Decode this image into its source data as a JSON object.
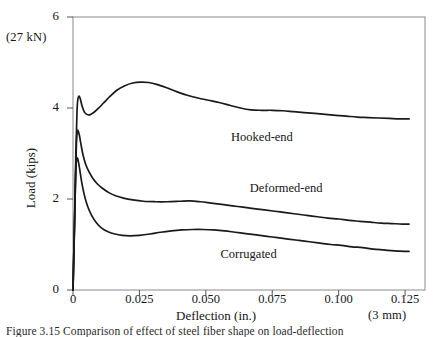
{
  "chart_data": {
    "type": "line",
    "title": "",
    "xlabel": "Deflection (in.)",
    "ylabel": "Load (kips)",
    "xlim": [
      0,
      0.1325
    ],
    "ylim": [
      0,
      6
    ],
    "xticks": [
      "0",
      "0.025",
      "0.050",
      "0.075",
      "0.100",
      "0.125"
    ],
    "xtick_values": [
      0,
      0.025,
      0.05,
      0.075,
      0.1,
      0.125
    ],
    "yticks": [
      "0",
      "2",
      "4",
      "6"
    ],
    "ytick_values": [
      0,
      2,
      4,
      6
    ],
    "grid": false,
    "legend_position": "inline-annotations",
    "annotations": {
      "y_axis_top_note": "(27 kN)",
      "x_axis_right_note": "(3 mm)"
    },
    "series": [
      {
        "name": "Hooked-end",
        "label_x": 0.0595,
        "label_y": 3.33,
        "points": [
          [
            0.0,
            0.0
          ],
          [
            0.0006,
            1.6
          ],
          [
            0.0011,
            3.05
          ],
          [
            0.0015,
            3.9
          ],
          [
            0.0018,
            4.18
          ],
          [
            0.0022,
            4.26
          ],
          [
            0.0027,
            4.21
          ],
          [
            0.0034,
            4.05
          ],
          [
            0.0042,
            3.92
          ],
          [
            0.0052,
            3.86
          ],
          [
            0.0063,
            3.85
          ],
          [
            0.0078,
            3.9
          ],
          [
            0.0095,
            3.99
          ],
          [
            0.0115,
            4.11
          ],
          [
            0.014,
            4.26
          ],
          [
            0.0165,
            4.39
          ],
          [
            0.0195,
            4.49
          ],
          [
            0.0225,
            4.55
          ],
          [
            0.0255,
            4.57
          ],
          [
            0.0285,
            4.56
          ],
          [
            0.0315,
            4.52
          ],
          [
            0.035,
            4.45
          ],
          [
            0.039,
            4.36
          ],
          [
            0.043,
            4.28
          ],
          [
            0.047,
            4.22
          ],
          [
            0.051,
            4.17
          ],
          [
            0.055,
            4.12
          ],
          [
            0.059,
            4.06
          ],
          [
            0.063,
            4.0
          ],
          [
            0.067,
            3.96
          ],
          [
            0.071,
            3.95
          ],
          [
            0.075,
            3.95
          ],
          [
            0.079,
            3.94
          ],
          [
            0.083,
            3.92
          ],
          [
            0.087,
            3.9
          ],
          [
            0.091,
            3.88
          ],
          [
            0.095,
            3.86
          ],
          [
            0.099,
            3.84
          ],
          [
            0.103,
            3.82
          ],
          [
            0.107,
            3.8
          ],
          [
            0.111,
            3.79
          ],
          [
            0.115,
            3.78
          ],
          [
            0.119,
            3.77
          ],
          [
            0.123,
            3.76
          ],
          [
            0.1265,
            3.76
          ]
        ]
      },
      {
        "name": "Deformed-end",
        "label_x": 0.0665,
        "label_y": 2.22,
        "points": [
          [
            0.0,
            0.0
          ],
          [
            0.0006,
            1.45
          ],
          [
            0.001,
            2.6
          ],
          [
            0.0013,
            3.25
          ],
          [
            0.0016,
            3.48
          ],
          [
            0.0019,
            3.5
          ],
          [
            0.0024,
            3.4
          ],
          [
            0.003,
            3.2
          ],
          [
            0.0038,
            2.96
          ],
          [
            0.0048,
            2.76
          ],
          [
            0.006,
            2.6
          ],
          [
            0.0075,
            2.45
          ],
          [
            0.0092,
            2.33
          ],
          [
            0.0112,
            2.23
          ],
          [
            0.0135,
            2.14
          ],
          [
            0.016,
            2.07
          ],
          [
            0.019,
            2.02
          ],
          [
            0.0225,
            1.98
          ],
          [
            0.0265,
            1.95
          ],
          [
            0.031,
            1.94
          ],
          [
            0.0355,
            1.94
          ],
          [
            0.04,
            1.95
          ],
          [
            0.044,
            1.96
          ],
          [
            0.048,
            1.94
          ],
          [
            0.052,
            1.91
          ],
          [
            0.056,
            1.88
          ],
          [
            0.06,
            1.85
          ],
          [
            0.064,
            1.82
          ],
          [
            0.068,
            1.79
          ],
          [
            0.072,
            1.76
          ],
          [
            0.076,
            1.73
          ],
          [
            0.08,
            1.7
          ],
          [
            0.084,
            1.67
          ],
          [
            0.088,
            1.64
          ],
          [
            0.092,
            1.61
          ],
          [
            0.096,
            1.58
          ],
          [
            0.1,
            1.56
          ],
          [
            0.104,
            1.53
          ],
          [
            0.108,
            1.51
          ],
          [
            0.112,
            1.49
          ],
          [
            0.116,
            1.47
          ],
          [
            0.12,
            1.46
          ],
          [
            0.124,
            1.45
          ],
          [
            0.1265,
            1.45
          ]
        ]
      },
      {
        "name": "Corrugated",
        "label_x": 0.0555,
        "label_y": 0.77,
        "points": [
          [
            0.0,
            0.0
          ],
          [
            0.0005,
            1.3
          ],
          [
            0.0009,
            2.3
          ],
          [
            0.0012,
            2.78
          ],
          [
            0.0015,
            2.9
          ],
          [
            0.0019,
            2.86
          ],
          [
            0.0025,
            2.66
          ],
          [
            0.0033,
            2.36
          ],
          [
            0.0043,
            2.08
          ],
          [
            0.0055,
            1.84
          ],
          [
            0.007,
            1.64
          ],
          [
            0.0088,
            1.48
          ],
          [
            0.0108,
            1.36
          ],
          [
            0.0132,
            1.28
          ],
          [
            0.0158,
            1.23
          ],
          [
            0.0185,
            1.2
          ],
          [
            0.0215,
            1.19
          ],
          [
            0.025,
            1.2
          ],
          [
            0.029,
            1.23
          ],
          [
            0.033,
            1.27
          ],
          [
            0.037,
            1.3
          ],
          [
            0.041,
            1.32
          ],
          [
            0.045,
            1.33
          ],
          [
            0.049,
            1.33
          ],
          [
            0.053,
            1.32
          ],
          [
            0.057,
            1.3
          ],
          [
            0.061,
            1.27
          ],
          [
            0.065,
            1.24
          ],
          [
            0.069,
            1.21
          ],
          [
            0.073,
            1.18
          ],
          [
            0.077,
            1.15
          ],
          [
            0.081,
            1.12
          ],
          [
            0.085,
            1.09
          ],
          [
            0.089,
            1.06
          ],
          [
            0.093,
            1.03
          ],
          [
            0.097,
            1.0
          ],
          [
            0.101,
            0.98
          ],
          [
            0.105,
            0.95
          ],
          [
            0.109,
            0.93
          ],
          [
            0.113,
            0.9
          ],
          [
            0.117,
            0.88
          ],
          [
            0.121,
            0.86
          ],
          [
            0.125,
            0.85
          ],
          [
            0.1265,
            0.85
          ]
        ]
      }
    ],
    "style": {
      "curve_color": "#1a1a1a",
      "frame_color": "#8a8a8a",
      "background": "#ffffff"
    }
  },
  "caption": "Figure 3.15  Comparison of effect of steel fiber shape on load-deflection"
}
